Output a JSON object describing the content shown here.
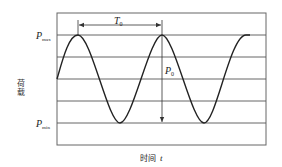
{
  "diagram": {
    "type": "sinusoidal-load-waveform",
    "y_axis_label": "荷载",
    "x_axis_label": "时间",
    "x_axis_symbol": "t",
    "labels": {
      "p_max_base": "P",
      "p_max_sub": "max",
      "p_min_base": "P",
      "p_min_sub": "min",
      "period_base": "T",
      "period_sub": "0",
      "amplitude_base": "P",
      "amplitude_sub": "0"
    },
    "colors": {
      "curve": "#222222",
      "grid": "#555555",
      "frame": "#666666",
      "text": "#222222"
    },
    "grid_rows": 6
  }
}
